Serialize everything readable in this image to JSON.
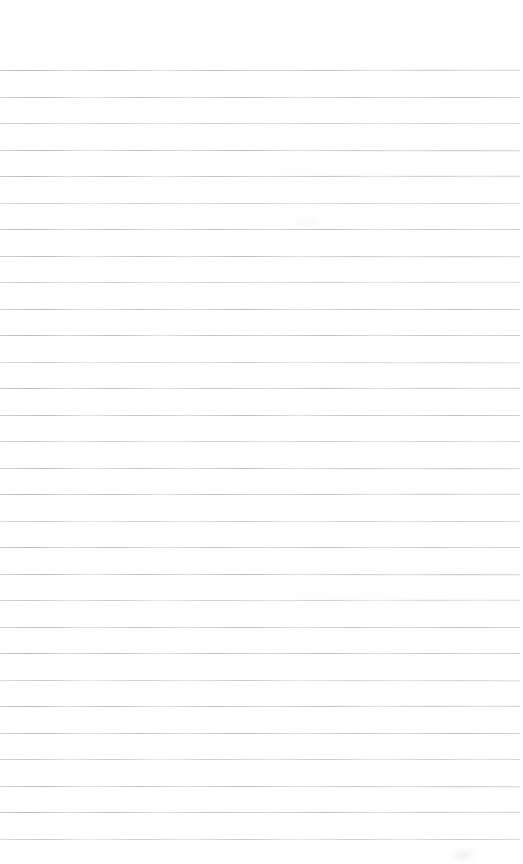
{
  "document": {
    "kind": "scanned-ruled-notebook-page",
    "title": "Blank Ruled Page",
    "page_width": 523,
    "page_height": 864,
    "background_color": "#ffffff",
    "text_content": "",
    "has_handwriting": false,
    "has_printed_text": false,
    "has_margin_rule": false,
    "orientation": "portrait"
  },
  "ruling": {
    "line_color": "#bcc1c9",
    "line_color_light": "#cdd2d8",
    "line_thickness_px": 1,
    "line_spacing_px": 26.5,
    "first_line_y": 70,
    "last_line_y": 839,
    "line_count": 30,
    "line_left_x": 0,
    "line_right_x": 520,
    "top_margin_px": 70,
    "bottom_margin_px": 25,
    "line_y_positions": [
      70,
      96.5,
      123,
      149.5,
      176,
      202.5,
      229,
      255.5,
      282,
      308.5,
      335,
      361.5,
      388,
      414.5,
      441,
      467.5,
      494,
      520.5,
      547,
      573.5,
      600,
      626.5,
      653,
      679.5,
      706,
      732.5,
      759,
      785.5,
      812,
      838.5
    ]
  },
  "artifacts": {
    "line_break": {
      "label": "rule-gap",
      "x": 244,
      "y": 222,
      "width": 15,
      "height": 5
    },
    "smudge_bottom": {
      "label": "faint-smudge",
      "x": 450,
      "y": 848,
      "width": 26,
      "height": 14
    },
    "smudge_mid": {
      "label": "faint-smudge",
      "x": 296,
      "y": 217,
      "width": 24,
      "height": 10
    }
  }
}
